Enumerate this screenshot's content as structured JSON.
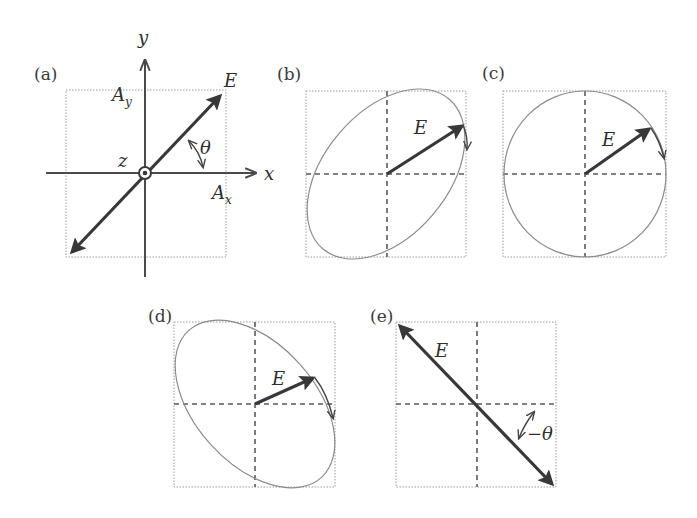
{
  "figure": {
    "panels": [
      {
        "id": "a",
        "label": "(a)",
        "axes": {
          "x": "x",
          "y": "y",
          "z": "z"
        },
        "vector": "E",
        "amplitude_x": "A",
        "amplitude_x_sub": "x",
        "amplitude_y": "A",
        "amplitude_y_sub": "y",
        "angle": "θ",
        "polarization": "linear"
      },
      {
        "id": "b",
        "label": "(b)",
        "vector": "E",
        "polarization": "elliptical (tilted +)"
      },
      {
        "id": "c",
        "label": "(c)",
        "vector": "E",
        "polarization": "circular"
      },
      {
        "id": "d",
        "label": "(d)",
        "vector": "E",
        "polarization": "elliptical (tilted −)"
      },
      {
        "id": "e",
        "label": "(e)",
        "vector": "E",
        "angle": "−θ",
        "polarization": "linear (−θ)"
      }
    ]
  }
}
